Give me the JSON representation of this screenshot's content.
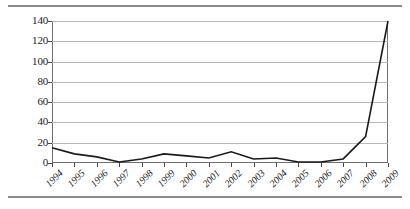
{
  "figure": {
    "has_top_rule": true,
    "has_bottom_rule": true,
    "rule_color": "#8a8a8a",
    "background": "#ffffff"
  },
  "chart_data": {
    "type": "line",
    "title": "",
    "subtitle": "",
    "xlabel": "",
    "ylabel": "",
    "categories": [
      "1994",
      "1995",
      "1996",
      "1997",
      "1998",
      "1999",
      "2000",
      "2001",
      "2002",
      "2003",
      "2004",
      "2005",
      "2006",
      "2007",
      "2008",
      "2009"
    ],
    "series": [
      {
        "name": "",
        "values": [
          15,
          9,
          6,
          1,
          4,
          9,
          7,
          5,
          11,
          4,
          5,
          1,
          1,
          4,
          26,
          140
        ]
      }
    ],
    "ylim": [
      0,
      140
    ],
    "yticks": [
      0,
      20,
      40,
      60,
      80,
      100,
      120,
      140
    ],
    "ytick_labels": [
      "0",
      "20",
      "40",
      "60",
      "80",
      "100",
      "120",
      "140"
    ],
    "grid": "horizontal",
    "legend": "none",
    "line_color": "#1a1a1a",
    "gridline_color": "#b9b9b9",
    "axis_color": "#6f6f6f",
    "markers": false,
    "xtick_rotation": -45
  }
}
